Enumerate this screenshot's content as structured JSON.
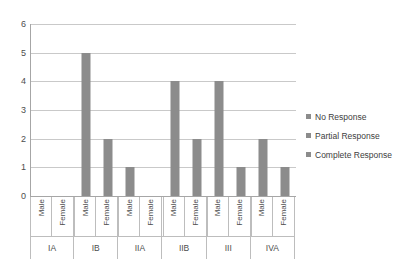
{
  "chart_data": {
    "type": "bar",
    "title": "",
    "xlabel": "",
    "ylabel": "",
    "ylim": [
      0,
      6
    ],
    "yticks": [
      "0",
      "1",
      "2",
      "3",
      "4",
      "5",
      "6"
    ],
    "grid": true,
    "legend_position": "right",
    "groups": [
      "IA",
      "IB",
      "IIA",
      "IIB",
      "III",
      "IVA"
    ],
    "subcategories": [
      "Male",
      "Female"
    ],
    "categories": [
      "IA Male",
      "IA Female",
      "IB Male",
      "IB Female",
      "IIA Male",
      "IIA Female",
      "IIB Male",
      "IIB Female",
      "III Male",
      "III Female",
      "IVA Male",
      "IVA Female"
    ],
    "values": [
      0,
      0,
      5,
      2,
      1,
      0,
      4,
      2,
      4,
      1,
      2,
      1
    ],
    "series": [
      {
        "name": "Complete Response",
        "values": [
          0,
          0,
          5,
          2,
          1,
          0,
          4,
          2,
          4,
          1,
          2,
          1
        ]
      }
    ],
    "legend": [
      {
        "label": "No Response",
        "color": "#8c8c8c"
      },
      {
        "label": "Partial Response",
        "color": "#8c8c8c"
      },
      {
        "label": "Complete Response",
        "color": "#8c8c8c"
      }
    ],
    "bar_color": "#8c8c8c",
    "gridline_color": "#c9c9c9",
    "axis_color": "#a6a6a6",
    "text_color": "#4d4d4d"
  }
}
